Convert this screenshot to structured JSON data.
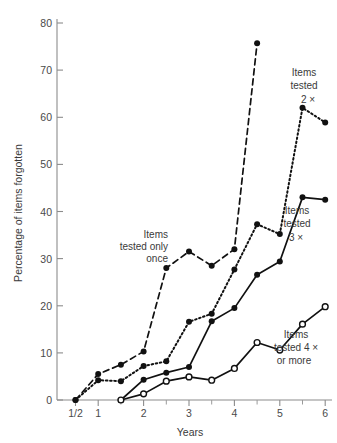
{
  "chart_data": {
    "type": "line",
    "title": "",
    "subtitle": "",
    "xlabel": "Years",
    "ylabel": "Percentage of items forgotten",
    "xlim": [
      0,
      6.35
    ],
    "ylim": [
      0,
      80
    ],
    "grid": false,
    "legend_position": "inline-annotations",
    "x_tick_labels": [
      "1/2",
      "1",
      "2",
      "3",
      "4",
      "5",
      "6"
    ],
    "x_tick_values": [
      0.5,
      1,
      2,
      3,
      4,
      5,
      6
    ],
    "x_minor_tick_values": [
      1.5,
      2.5,
      3.5,
      4.5,
      5.5
    ],
    "y_tick_labels": [
      "0",
      "10",
      "20",
      "30",
      "40",
      "50",
      "60",
      "70",
      "80"
    ],
    "y_tick_values": [
      0,
      10,
      20,
      30,
      40,
      50,
      60,
      70,
      80
    ],
    "series": [
      {
        "name": "Items tested only once",
        "style": "dashed",
        "marker": "filled-circle",
        "x": [
          0.5,
          1.0,
          1.5,
          2.0,
          2.5,
          3.0,
          3.5,
          4.0,
          4.5
        ],
        "values": [
          0,
          5.5,
          7.5,
          10.3,
          28.0,
          31.5,
          28.5,
          32.0,
          75.7
        ]
      },
      {
        "name": "Items tested 2 ×",
        "style": "dotted",
        "marker": "filled-circle",
        "x": [
          0.5,
          1.0,
          1.5,
          2.0,
          2.5,
          3.0,
          3.5,
          4.0,
          4.5,
          5.0,
          5.5,
          6.0
        ],
        "values": [
          0,
          4.2,
          4.0,
          7.2,
          8.2,
          16.6,
          18.3,
          27.7,
          37.3,
          35.2,
          62.0,
          58.9
        ]
      },
      {
        "name": "Items tested 3 ×",
        "style": "solid",
        "marker": "filled-circle",
        "x": [
          1.5,
          2.0,
          2.5,
          3.0,
          3.5,
          4.0,
          4.5,
          5.0,
          5.5,
          6.0
        ],
        "values": [
          0,
          4.3,
          5.8,
          7.0,
          16.7,
          19.5,
          26.6,
          29.4,
          43.0,
          42.5
        ]
      },
      {
        "name": "Items tested 4 × or more",
        "style": "solid",
        "marker": "open-circle",
        "x": [
          1.5,
          2.0,
          2.5,
          3.0,
          3.5,
          4.0,
          4.5,
          5.0,
          5.5,
          6.0
        ],
        "values": [
          0,
          1.3,
          4.0,
          4.9,
          4.2,
          6.7,
          12.2,
          10.6,
          16.1,
          19.8
        ]
      }
    ],
    "annotations": [
      {
        "id": "once",
        "lines": [
          "Items",
          "tested only",
          "once"
        ]
      },
      {
        "id": "twice",
        "lines": [
          "Items",
          "tested",
          "2 ×"
        ]
      },
      {
        "id": "thrice",
        "lines": [
          "Items",
          "tested",
          "3 ×"
        ]
      },
      {
        "id": "four-plus",
        "lines": [
          "Items",
          "tested 4 ×",
          "or more"
        ]
      }
    ],
    "colors": {
      "line": "#111111",
      "axis": "#8c8c8c",
      "text": "#3a3a3a",
      "background": "#ffffff"
    }
  }
}
